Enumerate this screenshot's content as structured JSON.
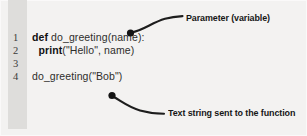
{
  "figure": {
    "background_color": "#f3f2f1",
    "gutter_color": "#dedddb",
    "ink_color": "#161616"
  },
  "code": {
    "language": "Python",
    "lines": [
      {
        "number": "1",
        "indent": 0,
        "keyword": "def",
        "rest": " do_greeting(name):",
        "full": "def do_greeting(name):"
      },
      {
        "number": "2",
        "indent": 1,
        "keyword": "print",
        "rest": "(\"Hello\", name)",
        "full": "print(\"Hello\", name)"
      },
      {
        "number": "3",
        "indent": 0,
        "keyword": "",
        "rest": "",
        "full": ""
      },
      {
        "number": "4",
        "indent": 0,
        "keyword": "",
        "rest": "do_greeting(\"Bob\")",
        "full": "do_greeting(\"Bob\")"
      }
    ]
  },
  "annotations": [
    {
      "id": "parameter",
      "label": "Parameter (variable)",
      "points_to": "name",
      "dot": {
        "x": 130,
        "y": 33
      }
    },
    {
      "id": "string",
      "label": "Text string sent to the function",
      "points_to": "\"Bob\"",
      "dot": {
        "x": 112,
        "y": 95
      }
    }
  ]
}
